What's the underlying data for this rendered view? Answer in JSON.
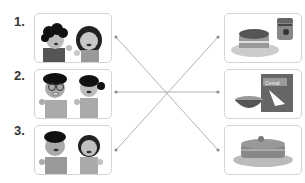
{
  "exercise": {
    "type": "matching",
    "left_items": [
      {
        "number": "1.",
        "image": "boy-and-girl-waving"
      },
      {
        "number": "2.",
        "image": "boy-with-glasses-and-girl-pigtail"
      },
      {
        "number": "3.",
        "image": "boy-and-girl-smiling"
      }
    ],
    "right_items": [
      {
        "image": "toast-with-jam"
      },
      {
        "image": "cereal-bowl-and-box",
        "box_text": "Cereal"
      },
      {
        "image": "pancakes-stack"
      }
    ],
    "connections": [
      {
        "from": 1,
        "to": 3
      },
      {
        "from": 2,
        "to": 2
      },
      {
        "from": 3,
        "to": 1
      }
    ],
    "colors": {
      "line": "#9a9a9a",
      "border": "#d4d4d4",
      "number": "#333333"
    }
  }
}
